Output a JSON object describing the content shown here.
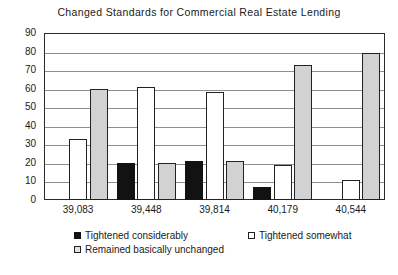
{
  "chart_data": {
    "type": "bar",
    "title": "Changed Standards for Commercial Real Estate Lending",
    "xlabel": "",
    "ylabel": "",
    "ylim": [
      0,
      90
    ],
    "ytick_step": 10,
    "yticks": [
      "0",
      "10",
      "20",
      "30",
      "40",
      "50",
      "60",
      "70",
      "80",
      "90"
    ],
    "grid": true,
    "legend_position": "bottom",
    "categories": [
      "39,083",
      "39,448",
      "39,814",
      "40,179",
      "40,544"
    ],
    "series": [
      {
        "name": "Tightened considerably",
        "color": "#121212",
        "values": [
          0,
          20,
          21,
          7,
          0
        ]
      },
      {
        "name": "Tightened somewhat",
        "color": "#ffffff",
        "values": [
          33,
          61,
          58,
          19,
          11
        ]
      },
      {
        "name": "Remained basically unchanged",
        "color": "#d2d2d2",
        "values": [
          60,
          20,
          21,
          73,
          79
        ]
      }
    ]
  }
}
